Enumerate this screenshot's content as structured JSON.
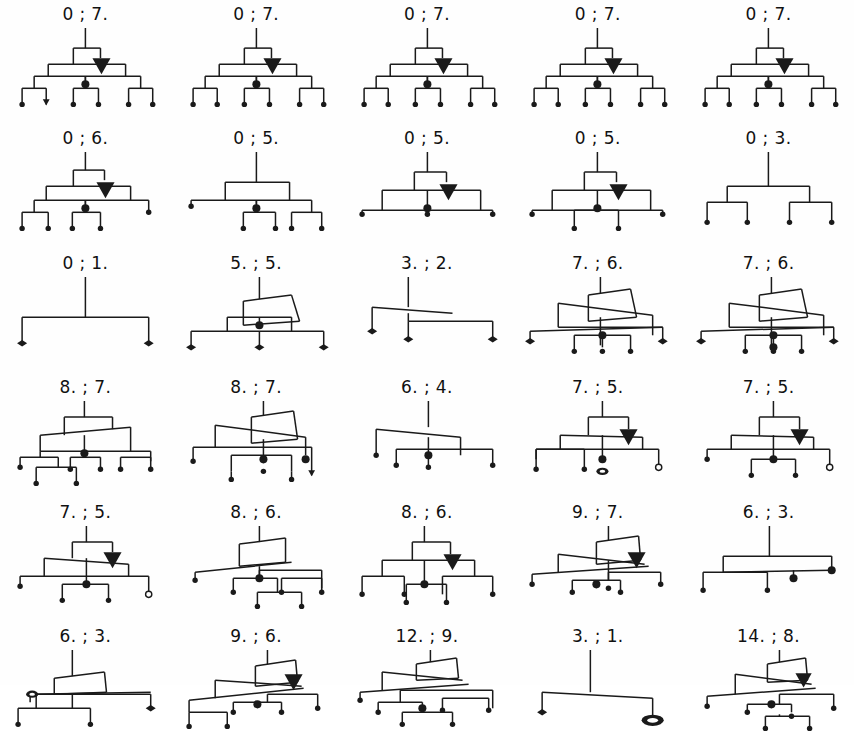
{
  "figure": {
    "columns": 5,
    "rows": 6,
    "background_color": "#ffffff",
    "line_color": "#1a1a1a",
    "label_color": "#111111",
    "separator": ";"
  },
  "legend": {
    "node_kinds": [
      {
        "name": "filled-dot-terminal",
        "symbol": "filled-circle"
      },
      {
        "name": "arrow-head-terminal",
        "symbol": "down-arrow"
      },
      {
        "name": "hollow-circle-terminal",
        "symbol": "open-circle"
      },
      {
        "name": "diamond-terminal",
        "symbol": "filled-diamond"
      },
      {
        "name": "ring-terminal",
        "symbol": "thick-ring"
      },
      {
        "name": "solid-triangle-marker",
        "symbol": "filled-down-triangle"
      }
    ]
  },
  "cells": [
    {
      "id": "r1c1",
      "row": 1,
      "col": 1,
      "label": "0 ; 7.",
      "left": "0",
      "right": "7.",
      "shape": "sym6",
      "marker": "triangle",
      "leaves": 6,
      "terminals": [
        "dot",
        "arrow",
        "dot",
        "dot",
        "dot",
        "dot"
      ]
    },
    {
      "id": "r1c2",
      "row": 1,
      "col": 2,
      "label": "0 ; 7.",
      "left": "0",
      "right": "7.",
      "shape": "sym6",
      "marker": "triangle",
      "leaves": 6,
      "terminals": [
        "dot",
        "dot",
        "dot",
        "dot",
        "dot",
        "dot"
      ]
    },
    {
      "id": "r1c3",
      "row": 1,
      "col": 3,
      "label": "0 ; 7.",
      "left": "0",
      "right": "7.",
      "shape": "sym6",
      "marker": "triangle",
      "leaves": 6,
      "terminals": [
        "dot",
        "dot",
        "dot",
        "dot",
        "dot",
        "dot"
      ]
    },
    {
      "id": "r1c4",
      "row": 1,
      "col": 4,
      "label": "0 ; 7.",
      "left": "0",
      "right": "7.",
      "shape": "sym6",
      "marker": "triangle",
      "leaves": 6,
      "terminals": [
        "dot",
        "dot",
        "dot",
        "dot",
        "dot",
        "dot"
      ]
    },
    {
      "id": "r1c5",
      "row": 1,
      "col": 5,
      "label": "0 ; 7.",
      "left": "0",
      "right": "7.",
      "shape": "sym6",
      "marker": "triangle",
      "leaves": 6,
      "terminals": [
        "dot",
        "dot",
        "dot",
        "dot",
        "dot",
        "dot"
      ]
    },
    {
      "id": "r2c1",
      "row": 2,
      "col": 1,
      "label": "0 ; 6.",
      "left": "0",
      "right": "6.",
      "shape": "sym5a",
      "marker": "triangle",
      "leaves": 5,
      "terminals": [
        "dot",
        "dot",
        "dot",
        "dot",
        "dot"
      ]
    },
    {
      "id": "r2c2",
      "row": 2,
      "col": 2,
      "label": "0 ; 5.",
      "left": "0",
      "right": "5.",
      "shape": "flat5",
      "marker": "none",
      "leaves": 5,
      "terminals": [
        "dot",
        "dot",
        "dot",
        "dot",
        "dot"
      ]
    },
    {
      "id": "r2c3",
      "row": 2,
      "col": 3,
      "label": "0 ; 5.",
      "left": "0",
      "right": "5.",
      "shape": "sym4",
      "marker": "triangle",
      "leaves": 4,
      "terminals": [
        "dot",
        "dot",
        "dot",
        "dot"
      ]
    },
    {
      "id": "r2c4",
      "row": 2,
      "col": 4,
      "label": "0 ; 5.",
      "left": "0",
      "right": "5.",
      "shape": "sym4b",
      "marker": "triangle",
      "leaves": 4,
      "terminals": [
        "dot",
        "dot",
        "dot",
        "dot"
      ]
    },
    {
      "id": "r2c5",
      "row": 2,
      "col": 5,
      "label": "0 ; 3.",
      "left": "0",
      "right": "3.",
      "shape": "plain4",
      "marker": "none",
      "leaves": 4,
      "terminals": [
        "dot",
        "dot",
        "dot",
        "dot"
      ]
    },
    {
      "id": "r3c1",
      "row": 3,
      "col": 1,
      "label": "0 ; 1.",
      "left": "0",
      "right": "1.",
      "shape": "simple2",
      "marker": "none",
      "leaves": 2,
      "terminals": [
        "diamond",
        "diamond"
      ]
    },
    {
      "id": "r3c2",
      "row": 3,
      "col": 2,
      "label": "5. ; 5.",
      "left": "5.",
      "right": "5.",
      "shape": "skew3",
      "marker": "none",
      "leaves": 3,
      "terminals": [
        "diamond",
        "diamond",
        "diamond"
      ]
    },
    {
      "id": "r3c3",
      "row": 3,
      "col": 3,
      "label": "3. ; 2.",
      "left": "3.",
      "right": "2.",
      "shape": "skew2",
      "marker": "none",
      "leaves": 2,
      "terminals": [
        "diamond",
        "diamond"
      ]
    },
    {
      "id": "r3c4",
      "row": 3,
      "col": 4,
      "label": "7. ; 6.",
      "left": "7.",
      "right": "6.",
      "shape": "cross5",
      "marker": "none",
      "leaves": 5,
      "terminals": [
        "diamond",
        "dot",
        "dot",
        "dot",
        "diamond"
      ]
    },
    {
      "id": "r3c5",
      "row": 3,
      "col": 5,
      "label": "7. ; 6.",
      "left": "7.",
      "right": "6.",
      "shape": "cross5b",
      "marker": "none",
      "leaves": 5,
      "terminals": [
        "diamond",
        "dot",
        "dot",
        "dot",
        "diamond"
      ]
    },
    {
      "id": "r4c1",
      "row": 4,
      "col": 1,
      "label": "8. ; 7.",
      "left": "8.",
      "right": "7.",
      "shape": "deep6",
      "marker": "none",
      "leaves": 6,
      "terminals": [
        "dot",
        "dot",
        "dot",
        "dot",
        "dot",
        "dot"
      ]
    },
    {
      "id": "r4c2",
      "row": 4,
      "col": 2,
      "label": "8. ; 7.",
      "left": "8.",
      "right": "7.",
      "shape": "tangled6",
      "marker": "none",
      "leaves": 6,
      "terminals": [
        "dot",
        "dot",
        "dot",
        "dot",
        "arrow",
        "dot"
      ]
    },
    {
      "id": "r4c3",
      "row": 4,
      "col": 3,
      "label": "6. ; 4.",
      "left": "6.",
      "right": "4.",
      "shape": "slant4",
      "marker": "none",
      "leaves": 4,
      "terminals": [
        "dot",
        "dot",
        "dot",
        "dot"
      ]
    },
    {
      "id": "r4c4",
      "row": 4,
      "col": 4,
      "label": "7. ; 5.",
      "left": "7.",
      "right": "5.",
      "shape": "ringcell",
      "marker": "triangle",
      "leaves": 4,
      "terminals": [
        "dot",
        "dot",
        "ring",
        "hollow"
      ]
    },
    {
      "id": "r4c5",
      "row": 4,
      "col": 5,
      "label": "7. ; 5.",
      "left": "7.",
      "right": "5.",
      "shape": "ringcell2",
      "marker": "triangle",
      "leaves": 4,
      "terminals": [
        "dot",
        "dot",
        "dot",
        "hollow"
      ]
    },
    {
      "id": "r5c1",
      "row": 5,
      "col": 1,
      "label": "7. ; 5.",
      "left": "7.",
      "right": "5.",
      "shape": "hollow4",
      "marker": "triangle",
      "leaves": 4,
      "terminals": [
        "dot",
        "dot",
        "dot",
        "hollow"
      ]
    },
    {
      "id": "r5c2",
      "row": 5,
      "col": 2,
      "label": "8. ; 6.",
      "left": "8.",
      "right": "6.",
      "shape": "stair6",
      "marker": "none",
      "leaves": 6,
      "terminals": [
        "dot",
        "dot",
        "dot",
        "dot",
        "dot",
        "dot"
      ]
    },
    {
      "id": "r5c3",
      "row": 5,
      "col": 3,
      "label": "8. ; 6.",
      "left": "8.",
      "right": "6.",
      "shape": "nest5",
      "marker": "triangle",
      "leaves": 5,
      "terminals": [
        "dot",
        "dot",
        "dot",
        "dot",
        "dot"
      ]
    },
    {
      "id": "r5c4",
      "row": 5,
      "col": 4,
      "label": "9. ; 7.",
      "left": "9.",
      "right": "7.",
      "shape": "cascade6",
      "marker": "triangle",
      "leaves": 6,
      "terminals": [
        "dot",
        "dot",
        "dot",
        "dot",
        "dot",
        "dot"
      ]
    },
    {
      "id": "r5c5",
      "row": 5,
      "col": 5,
      "label": "6. ; 3.",
      "left": "6.",
      "right": "3.",
      "shape": "wide4",
      "marker": "none",
      "leaves": 4,
      "terminals": [
        "dot",
        "dot",
        "dot",
        "dot"
      ]
    },
    {
      "id": "r6c1",
      "row": 6,
      "col": 1,
      "label": "6. ; 3.",
      "left": "6.",
      "right": "3.",
      "shape": "ringtop3",
      "marker": "none",
      "leaves": 3,
      "terminals": [
        "dot",
        "dot",
        "diamond"
      ]
    },
    {
      "id": "r6c2",
      "row": 6,
      "col": 2,
      "label": "9. ; 6.",
      "left": "9.",
      "right": "6.",
      "shape": "cascade5",
      "marker": "triangle",
      "leaves": 5,
      "terminals": [
        "dot",
        "dot",
        "dot",
        "dot",
        "dot"
      ]
    },
    {
      "id": "r6c3",
      "row": 6,
      "col": 3,
      "label": "12. ; 9.",
      "left": "12.",
      "right": "9.",
      "shape": "dense7",
      "marker": "none",
      "leaves": 7,
      "terminals": [
        "dot",
        "dot",
        "dot",
        "dot",
        "dot",
        "dot",
        "dot"
      ]
    },
    {
      "id": "r6c4",
      "row": 6,
      "col": 4,
      "label": "3. ; 1.",
      "left": "3.",
      "right": "1.",
      "shape": "ring2",
      "marker": "none",
      "leaves": 2,
      "terminals": [
        "diamond",
        "ring"
      ]
    },
    {
      "id": "r6c5",
      "row": 6,
      "col": 5,
      "label": "14. ; 8.",
      "left": "14.",
      "right": "8.",
      "shape": "dense6",
      "marker": "triangle",
      "leaves": 6,
      "terminals": [
        "dot",
        "dot",
        "dot",
        "dot",
        "dot",
        "dot"
      ]
    }
  ]
}
